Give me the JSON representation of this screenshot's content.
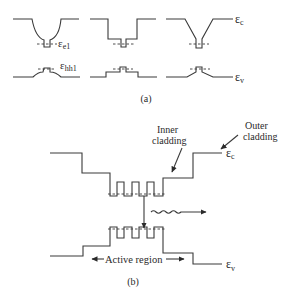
{
  "figure": {
    "part_a": {
      "caption": "(a)",
      "labels": {
        "electron_level": "ε",
        "electron_level_sub": "e1",
        "hole_level": "ε",
        "hole_level_sub": "hh1",
        "conduction_band": "ε",
        "conduction_band_sub": "c",
        "valence_band": "ε",
        "valence_band_sub": "v"
      },
      "panels": [
        "graded-index well",
        "step-index well",
        "linearly graded well"
      ]
    },
    "part_b": {
      "caption": "(b)",
      "labels": {
        "inner_cladding_line1": "Inner",
        "inner_cladding_line2": "cladding",
        "outer_cladding_line1": "Outer",
        "outer_cladding_line2": "cladding",
        "active_region": "Active region",
        "conduction_band": "ε",
        "conduction_band_sub": "c",
        "valence_band": "ε",
        "valence_band_sub": "v"
      }
    }
  }
}
